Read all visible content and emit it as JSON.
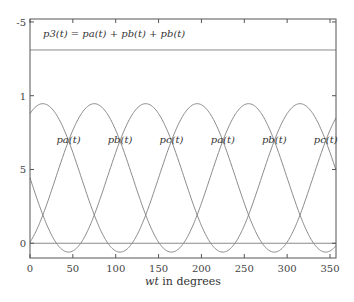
{
  "chart_data": {
    "type": "line",
    "title": "",
    "xlabel": "wt in degrees",
    "xlabel_italic_part": "wt",
    "xlabel_rest": " in degrees",
    "ylabel": "",
    "xlim": [
      0,
      357
    ],
    "ylim": [
      -1,
      15.2
    ],
    "grid": false,
    "x_ticks": [
      0,
      50,
      100,
      150,
      200,
      250,
      300,
      350
    ],
    "x_tick_labels": [
      "0",
      "50",
      "100",
      "150",
      "200",
      "250",
      "300",
      "350"
    ],
    "y_ticks": [
      15,
      10,
      5,
      0
    ],
    "y_tick_labels": [
      "-5",
      "1",
      "5",
      "0"
    ],
    "series": [
      {
        "name": "p_a(t)",
        "model": "4.43 + 5.03*cos(2*(wt-15deg))",
        "mean": 4.43,
        "amplitude": 5.03,
        "peak_deg": 15,
        "period_deg": 180,
        "x": [
          0,
          15,
          45,
          60,
          105,
          150,
          195,
          240,
          285,
          330,
          357
        ],
        "y": [
          8.79,
          9.46,
          6.95,
          4.43,
          -0.6,
          4.43,
          9.46,
          4.43,
          -0.6,
          4.43,
          9.2
        ]
      },
      {
        "name": "p_b(t)",
        "model": "4.43 + 5.03*cos(2*(wt-75deg))",
        "mean": 4.43,
        "amplitude": 5.03,
        "peak_deg": 75,
        "period_deg": 180,
        "x": [
          0,
          30,
          75,
          120,
          165,
          210,
          255,
          300,
          345,
          357
        ],
        "y": [
          0.07,
          4.43,
          9.46,
          4.43,
          -0.6,
          4.43,
          9.46,
          4.43,
          -0.6,
          0.2
        ]
      },
      {
        "name": "p_c(t)",
        "model": "4.43 + 5.03*cos(2*(wt-135deg))",
        "mean": 4.43,
        "amplitude": 5.03,
        "peak_deg": 135,
        "period_deg": 180,
        "x": [
          0,
          45,
          90,
          135,
          180,
          225,
          270,
          315,
          357
        ],
        "y": [
          4.43,
          -0.6,
          4.43,
          9.46,
          4.43,
          -0.6,
          4.43,
          9.46,
          5.5
        ]
      },
      {
        "name": "p_3(t) total",
        "constant": 13.1,
        "x": [
          0,
          357
        ],
        "y": [
          13.1,
          13.1
        ]
      },
      {
        "name": "zero reference",
        "constant": 0,
        "x": [
          0,
          357
        ],
        "y": [
          0,
          0
        ]
      }
    ],
    "annotations": [
      {
        "text": "p3(t) = pa(t) + pb(t) + pb(t)",
        "x_deg": 15,
        "y": 14.4
      },
      {
        "text": "pa(t)",
        "x_deg": 45,
        "y": 6.8
      },
      {
        "text": "pb(t)",
        "x_deg": 105,
        "y": 6.8
      },
      {
        "text": "pc(t)",
        "x_deg": 165,
        "y": 6.8
      },
      {
        "text": "pa(t)",
        "x_deg": 225,
        "y": 6.8
      },
      {
        "text": "pb(t)",
        "x_deg": 285,
        "y": 6.8
      },
      {
        "text": "pc(t)",
        "x_deg": 345,
        "y": 6.8
      }
    ],
    "colors": {
      "curves": "#8a8a8a",
      "frame": "#555555",
      "text": "#333333"
    }
  },
  "equation": {
    "lhs": "p3(t)",
    "rhs": "= pa(t) + pb(t) + pb(t)"
  },
  "curve_labels": [
    "pa(t)",
    "pb(t)",
    "pc(t)",
    "pa(t)",
    "pb(t)",
    "pc(t)"
  ]
}
